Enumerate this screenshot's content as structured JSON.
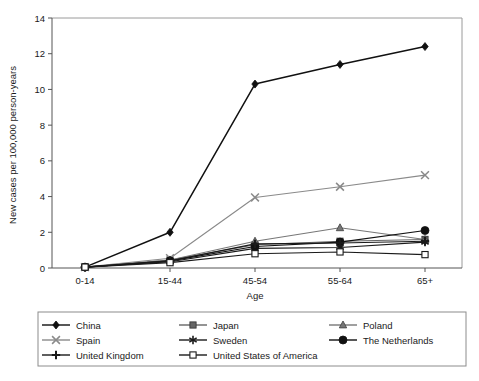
{
  "chart_data": {
    "type": "line",
    "title": "",
    "xlabel": "Age",
    "ylabel": "New cases per 100,000 person-years",
    "categories": [
      "0-14",
      "15-44",
      "45-54",
      "55-64",
      "65+"
    ],
    "ylim": [
      0,
      14
    ],
    "yticks": [
      0,
      2,
      4,
      6,
      8,
      10,
      12,
      14
    ],
    "grid": false,
    "legend_position": "bottom",
    "legend_columns": 3,
    "series": [
      {
        "name": "China",
        "marker": "filled-diamond",
        "color": "#111111",
        "values": [
          0.05,
          2.0,
          10.3,
          11.4,
          12.4
        ]
      },
      {
        "name": "Japan",
        "marker": "filled-square",
        "color": "#666666",
        "values": [
          0.05,
          0.45,
          1.3,
          1.5,
          1.6
        ]
      },
      {
        "name": "Poland",
        "marker": "filled-triangle",
        "color": "#777777",
        "values": [
          0.05,
          0.45,
          1.5,
          2.25,
          1.6
        ]
      },
      {
        "name": "Spain",
        "marker": "cross-x",
        "color": "#8a8a8a",
        "values": [
          0.05,
          0.55,
          3.95,
          4.55,
          5.2
        ]
      },
      {
        "name": "Sweden",
        "marker": "asterisk",
        "color": "#1a1a1a",
        "values": [
          0.05,
          0.35,
          1.1,
          1.15,
          1.45
        ]
      },
      {
        "name": "The Netherlands",
        "marker": "filled-circle",
        "color": "#111111",
        "values": [
          0.05,
          0.4,
          1.2,
          1.45,
          2.1
        ]
      },
      {
        "name": "United Kingdom",
        "marker": "plus",
        "color": "#1a1a1a",
        "values": [
          0.05,
          0.4,
          1.35,
          1.4,
          1.5
        ]
      },
      {
        "name": "United States of America",
        "marker": "open-square",
        "color": "#1a1a1a",
        "values": [
          0.05,
          0.3,
          0.8,
          0.9,
          0.75
        ]
      }
    ]
  },
  "legend": {
    "entries": [
      {
        "label": "China"
      },
      {
        "label": "Japan"
      },
      {
        "label": "Poland"
      },
      {
        "label": "Spain"
      },
      {
        "label": "Sweden"
      },
      {
        "label": "The Netherlands"
      },
      {
        "label": "United Kingdom"
      },
      {
        "label": "United States of America"
      }
    ]
  }
}
